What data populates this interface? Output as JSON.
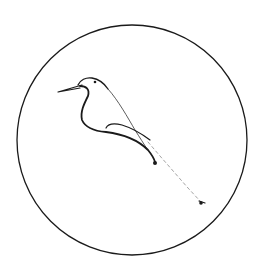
{
  "image": {
    "subject": "Minimalist single-line drawing of a bird perched, inside a circle",
    "colors": {
      "background": "#ffffff",
      "stroke": "#1a1a1a",
      "faint_stroke": "#9a9a9a"
    }
  },
  "circle": {
    "cx": 132,
    "cy": 140,
    "r": 115
  }
}
